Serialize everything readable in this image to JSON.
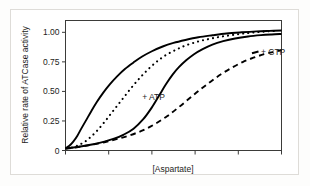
{
  "figure": {
    "background_color": "#ffffff",
    "outer_border_color": "#dedcd8",
    "axis_color": "#1d1d1b",
    "curve_color": "#000000"
  },
  "chart_data": {
    "type": "line",
    "title": "",
    "subtitle": "",
    "xlabel": "[Aspartate]",
    "ylabel": "Relative rate of ATCase activity",
    "grid": false,
    "legend_position": "inline-annotations",
    "xlim": [
      0,
      10
    ],
    "ylim": [
      0,
      1.1
    ],
    "x_tick_labels": [
      "",
      "",
      "",
      "",
      "",
      ""
    ],
    "y_tick_labels": [
      "0",
      "0.25",
      "0.50",
      "0.75",
      "1.00"
    ],
    "y_tick_values": [
      0,
      0.25,
      0.5,
      0.75,
      1.0
    ],
    "x_tick_values": [
      0,
      2,
      4,
      6,
      8,
      10
    ],
    "annotations": [
      {
        "text": "+ ATP",
        "x": 3.55,
        "y": 0.455,
        "series": "ATP"
      },
      {
        "text": "+ CTP",
        "x": 9.05,
        "y": 0.835,
        "series": "CTP"
      }
    ],
    "series": [
      {
        "name": "ATCase alone (no effector)",
        "label": "",
        "style": "solid",
        "description": "hyperbolic-like saturation curve, leftmost and highest",
        "x": [
          0.0,
          0.18,
          0.36,
          0.55,
          0.73,
          0.95,
          1.2,
          1.45,
          1.75,
          2.05,
          2.4,
          2.75,
          3.15,
          3.55,
          4.0,
          4.5,
          5.0,
          5.55,
          6.15,
          6.8,
          7.45,
          8.15,
          8.85,
          9.45,
          10.0
        ],
        "y": [
          0.02,
          0.04,
          0.075,
          0.125,
          0.185,
          0.255,
          0.335,
          0.41,
          0.49,
          0.56,
          0.63,
          0.69,
          0.745,
          0.795,
          0.84,
          0.88,
          0.91,
          0.935,
          0.958,
          0.975,
          0.99,
          1.0,
          1.008,
          1.012,
          1.015
        ]
      },
      {
        "name": "+ ATP",
        "label": "+ ATP",
        "style": "dotted",
        "description": "sigmoidal curve shifted left, converges with the no-effector curve at saturation",
        "x": [
          0.3,
          0.6,
          0.9,
          1.2,
          1.5,
          1.8,
          2.1,
          2.4,
          2.7,
          3.0,
          3.3,
          3.6,
          3.9,
          4.2,
          4.5,
          4.85,
          5.2,
          5.55,
          5.95,
          6.35,
          6.8,
          7.25,
          7.75,
          8.25,
          8.8,
          9.35,
          9.85
        ],
        "y": [
          0.025,
          0.045,
          0.075,
          0.12,
          0.175,
          0.24,
          0.31,
          0.38,
          0.45,
          0.52,
          0.585,
          0.645,
          0.7,
          0.748,
          0.79,
          0.828,
          0.86,
          0.888,
          0.912,
          0.932,
          0.95,
          0.965,
          0.978,
          0.99,
          1.0,
          1.008,
          1.013
        ]
      },
      {
        "name": "ATCase (sigmoidal, no effector reference)",
        "label": "",
        "style": "solid",
        "description": "sigmoidal curve in the middle-right of the plot",
        "x": [
          0.0,
          0.45,
          0.9,
          1.35,
          1.8,
          2.25,
          2.7,
          3.15,
          3.6,
          4.0,
          4.35,
          4.65,
          4.95,
          5.25,
          5.6,
          5.95,
          6.35,
          6.8,
          7.3,
          7.85,
          8.45,
          9.05,
          9.55,
          10.0
        ],
        "y": [
          0.018,
          0.028,
          0.04,
          0.055,
          0.075,
          0.1,
          0.135,
          0.185,
          0.265,
          0.365,
          0.47,
          0.56,
          0.64,
          0.705,
          0.765,
          0.815,
          0.858,
          0.896,
          0.925,
          0.948,
          0.965,
          0.976,
          0.982,
          0.986
        ]
      },
      {
        "name": "+ CTP",
        "label": "+ CTP",
        "style": "dashed",
        "description": "sigmoidal curve shifted right, lowest of all curves",
        "x": [
          0.0,
          0.6,
          1.2,
          1.8,
          2.4,
          3.0,
          3.6,
          4.15,
          4.7,
          5.2,
          5.7,
          6.2,
          6.7,
          7.2,
          7.7,
          8.2,
          8.7,
          9.2,
          9.65,
          10.0
        ],
        "y": [
          0.015,
          0.03,
          0.048,
          0.07,
          0.098,
          0.13,
          0.172,
          0.225,
          0.29,
          0.36,
          0.435,
          0.51,
          0.58,
          0.645,
          0.7,
          0.748,
          0.785,
          0.815,
          0.835,
          0.848
        ]
      }
    ]
  }
}
